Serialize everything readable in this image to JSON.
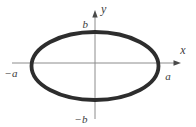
{
  "figure": {
    "type": "ellipse-diagram",
    "axes": {
      "x_label": "x",
      "y_label": "y"
    },
    "intercepts": {
      "x_positive": "a",
      "x_negative": "−a",
      "y_positive": "b",
      "y_negative": "−b"
    },
    "colors": {
      "background": "#ffffff",
      "ellipse_stroke": "#2d2d2d",
      "axis": "#8c8c8c",
      "arrow": "#4a4a4a",
      "label": "#3c3c3c"
    }
  }
}
